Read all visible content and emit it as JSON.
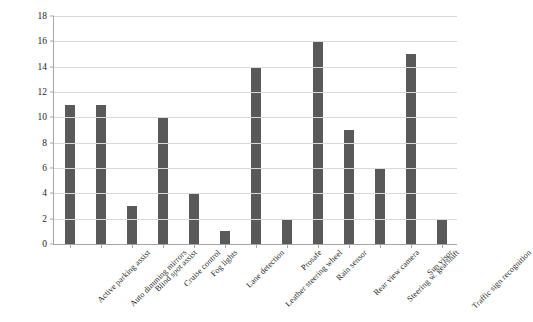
{
  "chart_data": {
    "type": "bar",
    "title": "",
    "xlabel": "",
    "ylabel": "Frequency",
    "ylim": [
      0,
      18
    ],
    "ytick_step": 2,
    "yticks": [
      0,
      2,
      4,
      6,
      8,
      10,
      12,
      14,
      16,
      18
    ],
    "grid": true,
    "legend": "none",
    "bar_color": "#595959",
    "gridline_color": "#d9d9d9",
    "axis_color": "#a6a6a6",
    "xtick_label_rotation_deg": 45,
    "categories": [
      "Active parking assist",
      "Auto dimming mirrors",
      "Blind spot assist",
      "Cruise control",
      "Fog lights",
      "Lane detection",
      "Leather steering wheel",
      "Prosafe",
      "Rain sensor",
      "Rear view camera",
      "Steering w. gearshift",
      "Sun visor",
      "Traffic sign recognition"
    ],
    "values": [
      11,
      11,
      3,
      10,
      4,
      1,
      14,
      2,
      16,
      9,
      6,
      15,
      2
    ]
  }
}
